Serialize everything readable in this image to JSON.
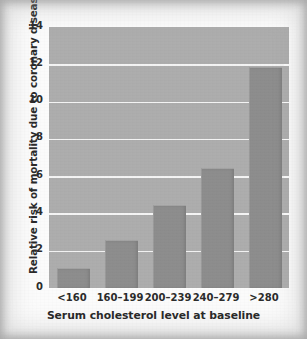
{
  "chart_data": {
    "type": "bar",
    "title": "",
    "xlabel": "Serum cholesterol level at baseline",
    "ylabel": "Relative risk of mortality due to coronary disease",
    "categories": [
      "<160",
      "160–199",
      "200–239",
      "240–279",
      ">280"
    ],
    "values": [
      1.0,
      2.5,
      4.4,
      6.4,
      11.8
    ],
    "ylim": [
      0,
      14
    ],
    "ytick_labels": [
      "0",
      "2",
      "4",
      "6",
      "8",
      "10",
      "12",
      "14"
    ],
    "ytick_values": [
      0,
      2,
      4,
      6,
      8,
      10,
      12,
      14
    ],
    "grid": true,
    "legend": "none",
    "colors": {
      "bar_fill": "#8d8d8d",
      "plot_background": "#adadad",
      "gridline": "#f4f4f4",
      "axis_frame": "#fdfdfd",
      "text": "#2b2b2b",
      "page_background": "#fbfbfb"
    }
  }
}
